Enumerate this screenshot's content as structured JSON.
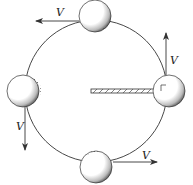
{
  "figure": {
    "type": "circular-motion",
    "colors": {
      "line": "#333333",
      "ball_fill": "#ffffff",
      "ball_shade": "#222222",
      "background": "#ffffff"
    }
  },
  "labels": {
    "velocity_top": "V",
    "velocity_right": "V",
    "velocity_left": "V",
    "velocity_bottom": "V"
  },
  "balls": [
    {
      "position": "top",
      "velocity_direction": "left"
    },
    {
      "position": "right",
      "velocity_direction": "up"
    },
    {
      "position": "left",
      "velocity_direction": "down"
    },
    {
      "position": "bottom",
      "velocity_direction": "right"
    }
  ],
  "annotations": {
    "right_angle_marker": "between rod and velocity vector at right ball"
  }
}
